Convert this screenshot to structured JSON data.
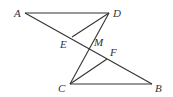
{
  "diagram": {
    "type": "geometry",
    "points": {
      "A": {
        "label": "A",
        "x": 25,
        "y": 13,
        "lx": 14,
        "ly": 17
      },
      "D": {
        "label": "D",
        "x": 109,
        "y": 13,
        "lx": 113,
        "ly": 17
      },
      "E": {
        "label": "E",
        "x": 72,
        "y": 37,
        "lx": 60,
        "ly": 48
      },
      "M": {
        "label": "M",
        "x": 89,
        "y": 49,
        "lx": 94,
        "ly": 46
      },
      "F": {
        "label": "F",
        "x": 107,
        "y": 59,
        "lx": 110,
        "ly": 56
      },
      "C": {
        "label": "C",
        "x": 70,
        "y": 84,
        "lx": 58,
        "ly": 92
      },
      "B": {
        "label": "B",
        "x": 152,
        "y": 84,
        "lx": 155,
        "ly": 92
      }
    },
    "segments": [
      [
        "A",
        "D"
      ],
      [
        "A",
        "B"
      ],
      [
        "D",
        "E"
      ],
      [
        "D",
        "C"
      ],
      [
        "C",
        "F"
      ],
      [
        "C",
        "B"
      ]
    ],
    "colors": {
      "stroke": "#333333",
      "label": "#333333",
      "background": "#ffffff"
    }
  }
}
